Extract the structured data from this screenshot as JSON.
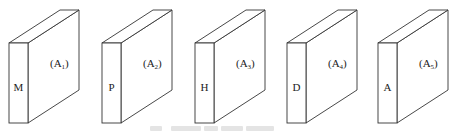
{
  "figure": {
    "panels": [
      {
        "id": "panel-1",
        "front_label": "M",
        "face_label_base": "(A",
        "face_label_sub": "1",
        "face_label_close": ")",
        "offset_x": 0
      },
      {
        "id": "panel-2",
        "front_label": "P",
        "face_label_base": "(A",
        "face_label_sub": "2",
        "face_label_close": ")",
        "offset_x": 93
      },
      {
        "id": "panel-3",
        "front_label": "H",
        "face_label_base": "(A",
        "face_label_sub": "3",
        "face_label_close": ")",
        "offset_x": 186
      },
      {
        "id": "panel-4",
        "front_label": "D",
        "face_label_base": "(A",
        "face_label_sub": "4",
        "face_label_close": ")",
        "offset_x": 278
      },
      {
        "id": "panel-5",
        "front_label": "A",
        "face_label_base": "(A",
        "face_label_sub": "5",
        "face_label_close": ")",
        "offset_x": 369
      }
    ],
    "caption": "",
    "caption_legible": false,
    "colors": {
      "stroke": "#333333",
      "fill": "#ffffff",
      "text": "#222222",
      "caption": "#e4e4e4"
    }
  }
}
